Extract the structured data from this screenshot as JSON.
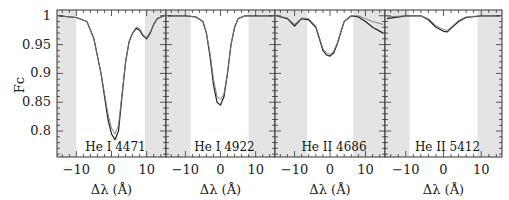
{
  "chart_data": {
    "type": "line",
    "layout": "4 horizontal panels sharing y-axis",
    "ylabel": "Fc",
    "xlabel": "Δλ (Å)",
    "ylim": [
      0.755,
      1.01
    ],
    "xlim": [
      -15.5,
      15.5
    ],
    "y_ticks": [
      1,
      0.95,
      0.9,
      0.85,
      0.8
    ],
    "y_tick_labels": [
      "1",
      "0.95",
      "0.9",
      "0.85",
      "0.8"
    ],
    "x_ticks": [
      -10,
      0,
      10
    ],
    "x_tick_labels": [
      "−10",
      "0",
      "10"
    ],
    "grid": false,
    "shaded_color": "#e4e4e4",
    "panels": [
      {
        "label": "He I 4471",
        "shaded_regions": [
          [
            -15.5,
            -10
          ],
          [
            9.5,
            15.5
          ]
        ],
        "series": [
          {
            "name": "observed",
            "x": [
              -15,
              -10,
              -7,
              -5,
              -3,
              -1,
              0,
              1,
              2,
              3,
              4,
              5,
              6,
              7,
              8,
              9,
              10,
              11,
              12,
              13,
              15
            ],
            "y": [
              1.0,
              0.997,
              0.99,
              0.96,
              0.9,
              0.82,
              0.795,
              0.785,
              0.8,
              0.86,
              0.92,
              0.955,
              0.97,
              0.978,
              0.975,
              0.965,
              0.96,
              0.97,
              0.985,
              0.995,
              1.0
            ]
          },
          {
            "name": "model",
            "x": [
              -15,
              -10,
              -7,
              -5,
              -3,
              -1,
              0,
              1,
              2,
              3,
              4,
              5,
              6,
              7,
              8,
              9,
              10,
              11,
              12,
              13,
              15
            ],
            "y": [
              1.0,
              0.997,
              0.99,
              0.96,
              0.9,
              0.83,
              0.805,
              0.795,
              0.81,
              0.865,
              0.92,
              0.955,
              0.97,
              0.98,
              0.978,
              0.967,
              0.962,
              0.972,
              0.985,
              0.995,
              1.0
            ]
          }
        ]
      },
      {
        "label": "He I 4922",
        "shaded_regions": [
          [
            -15.5,
            -8.5
          ],
          [
            8,
            15.5
          ]
        ],
        "series": [
          {
            "name": "observed",
            "x": [
              -15,
              -10,
              -7,
              -5,
              -4,
              -3,
              -2,
              -1,
              0,
              1,
              2,
              3,
              4,
              5,
              7,
              10,
              15
            ],
            "y": [
              1.0,
              1.0,
              0.998,
              0.99,
              0.97,
              0.93,
              0.88,
              0.85,
              0.845,
              0.86,
              0.9,
              0.95,
              0.98,
              0.995,
              1.0,
              1.0,
              1.0
            ]
          },
          {
            "name": "model",
            "x": [
              -15,
              -10,
              -7,
              -5,
              -4,
              -3,
              -2,
              -1,
              0,
              1,
              2,
              3,
              4,
              5,
              7,
              10,
              15
            ],
            "y": [
              1.0,
              1.0,
              0.998,
              0.99,
              0.97,
              0.935,
              0.89,
              0.86,
              0.855,
              0.865,
              0.9,
              0.95,
              0.98,
              0.995,
              1.0,
              1.0,
              1.0
            ]
          }
        ]
      },
      {
        "label": "He II 4686",
        "shaded_regions": [
          [
            -15.5,
            -6.5
          ],
          [
            6.5,
            15.5
          ]
        ],
        "series": [
          {
            "name": "observed",
            "x": [
              -15,
              -12,
              -10,
              -8,
              -6,
              -4,
              -3,
              -2,
              -1,
              0,
              1,
              2,
              3,
              4,
              6,
              8,
              10,
              12,
              15
            ],
            "y": [
              1.0,
              0.995,
              0.982,
              0.995,
              0.993,
              0.98,
              0.96,
              0.94,
              0.932,
              0.93,
              0.935,
              0.95,
              0.97,
              0.99,
              1.0,
              0.998,
              0.99,
              0.98,
              0.97
            ]
          },
          {
            "name": "model",
            "x": [
              -15,
              -12,
              -10,
              -8,
              -6,
              -4,
              -3,
              -2,
              -1,
              0,
              1,
              2,
              3,
              4,
              6,
              8,
              10,
              12,
              15
            ],
            "y": [
              1.0,
              0.996,
              0.985,
              0.996,
              0.995,
              0.982,
              0.962,
              0.943,
              0.935,
              0.933,
              0.938,
              0.952,
              0.972,
              0.99,
              1.0,
              1.0,
              0.995,
              0.99,
              0.985
            ]
          }
        ]
      },
      {
        "label": "He II 5412",
        "shaded_regions": [
          [
            -15.5,
            -9
          ],
          [
            9,
            15.5
          ]
        ],
        "series": [
          {
            "name": "observed",
            "x": [
              -15,
              -10,
              -6,
              -4,
              -2,
              0,
              1,
              2,
              4,
              6,
              10,
              15
            ],
            "y": [
              0.995,
              1.0,
              1.0,
              0.993,
              0.98,
              0.973,
              0.972,
              0.978,
              0.99,
              0.997,
              1.0,
              1.0
            ]
          },
          {
            "name": "model",
            "x": [
              -15,
              -10,
              -6,
              -4,
              -2,
              0,
              1,
              2,
              4,
              6,
              10,
              15
            ],
            "y": [
              0.998,
              1.0,
              1.0,
              0.995,
              0.983,
              0.976,
              0.975,
              0.98,
              0.992,
              0.998,
              1.0,
              1.0
            ]
          }
        ]
      }
    ]
  }
}
